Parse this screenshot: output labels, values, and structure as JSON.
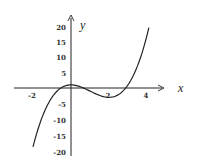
{
  "chart_data": {
    "type": "line",
    "title": "",
    "xlabel": "x",
    "ylabel": "y",
    "function": "y = x^3 - 3x^2 + 1",
    "xlim": [
      -2.9,
      4.6
    ],
    "ylim": [
      -21,
      22
    ],
    "x_ticks": [
      -2,
      2,
      4
    ],
    "y_ticks": [
      20,
      15,
      10,
      5,
      -5,
      -10,
      -15,
      -20
    ],
    "x_tick_labels": [
      "-2",
      "2",
      "4"
    ],
    "y_tick_labels": [
      "20",
      "15",
      "10",
      "5",
      "-5",
      "-10",
      "-15",
      "-20"
    ],
    "grid": false,
    "legend": null,
    "series": [
      {
        "name": "curve",
        "x": [
          -2,
          -1.5,
          -1,
          -0.5,
          0,
          0.5,
          1,
          1.5,
          2,
          2.5,
          3,
          3.5,
          4,
          4.1
        ],
        "values": [
          -19,
          -8.1,
          -3,
          -0.4,
          1,
          0.4,
          -1,
          -2.4,
          -3,
          -2.1,
          1,
          6.9,
          17,
          19.5
        ]
      }
    ],
    "key_points": {
      "local_max": [
        0,
        1
      ],
      "local_min": [
        2,
        -3
      ]
    }
  }
}
